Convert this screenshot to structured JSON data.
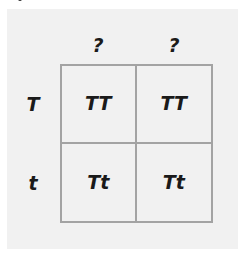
{
  "diagram": {
    "type": "punnett-square",
    "column_headers": [
      "?",
      "?"
    ],
    "row_headers": [
      "T",
      "t"
    ],
    "cells": [
      [
        "TT",
        "TT"
      ],
      [
        "Tt",
        "Tt"
      ]
    ]
  },
  "colors": {
    "panel_background": "#f1f1f1",
    "grid_border": "#a3a3a3",
    "text": "#1a1a1a"
  }
}
